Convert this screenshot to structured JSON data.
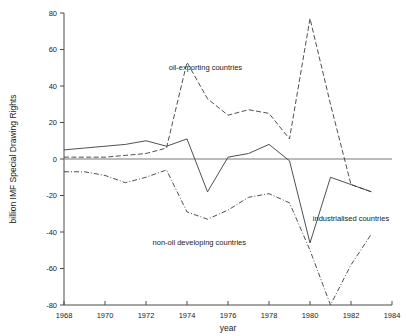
{
  "chart_data": {
    "type": "line",
    "title": "",
    "xlabel": "year",
    "ylabel": "billion IMF Special Drawing Rights",
    "xlim": [
      1968,
      1984
    ],
    "ylim": [
      -80,
      80
    ],
    "grid": false,
    "legend_position": "inline-annotations",
    "xticks": [
      1968,
      1970,
      1972,
      1974,
      1976,
      1978,
      1980,
      1982,
      1984
    ],
    "xtick_labels": [
      "1968",
      "1970",
      "1972",
      "1974",
      "1976",
      "1978",
      "1980",
      "1982",
      "1984"
    ],
    "yticks": [
      -80,
      -60,
      -40,
      -20,
      0,
      20,
      40,
      60,
      80
    ],
    "ytick_labels": [
      "-80",
      "-60",
      "-40",
      "-20",
      "0",
      "20",
      "40",
      "60",
      "80"
    ],
    "x": [
      1968,
      1969,
      1970,
      1971,
      1972,
      1973,
      1974,
      1975,
      1976,
      1977,
      1978,
      1979,
      1980,
      1981,
      1982,
      1983
    ],
    "series": [
      {
        "name": "industrialised countries",
        "style": "solid",
        "label": "industrialised countries",
        "label_x": 1982.0,
        "label_y": -34,
        "values": [
          5,
          6,
          7,
          8,
          10,
          7,
          11,
          -18,
          1,
          3,
          8,
          -1,
          -46,
          -10,
          -14,
          -18
        ]
      },
      {
        "name": "oil-exporting countries",
        "style": "dashed",
        "label": "oil-exporting countries",
        "label_x": 1974.9,
        "label_y": 49,
        "values": [
          1,
          1,
          1,
          2,
          3,
          6,
          53,
          33,
          24,
          27,
          25,
          11,
          77,
          30,
          -14,
          -18
        ]
      },
      {
        "name": "non-oil developing countries",
        "style": "dashdot",
        "label": "non-oil developing countries",
        "label_x": 1974.6,
        "label_y": -47,
        "values": [
          -7,
          -7,
          -9,
          -13,
          -10,
          -6,
          -29,
          -33,
          -28,
          -21,
          -19,
          -24,
          -50,
          -80,
          -58,
          -41
        ]
      }
    ]
  },
  "axes": {
    "y_axis_title": "billion IMF Special Drawing Rights",
    "x_axis_title": "year"
  }
}
